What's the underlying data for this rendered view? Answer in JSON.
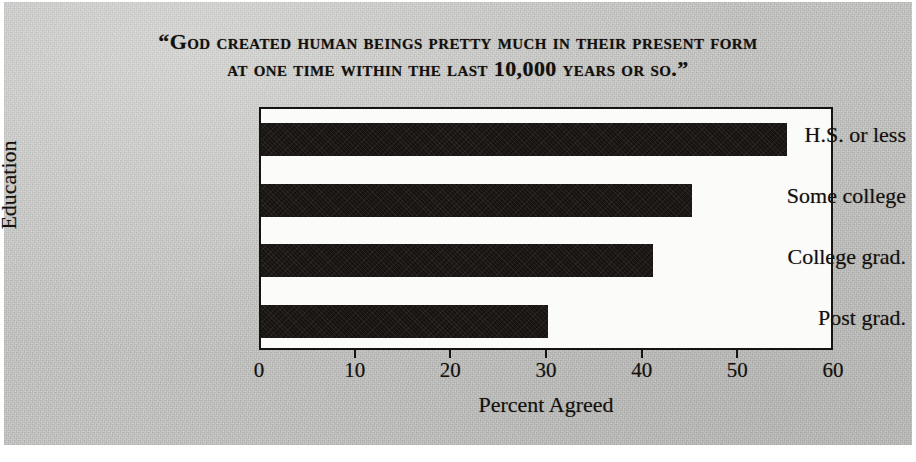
{
  "figure": {
    "title_lines": [
      "“God created human beings pretty much in their present form",
      "at one time within the last 10,000 years or so.”"
    ],
    "background_color": "#c9c9c7",
    "bar_color": "#171310",
    "plot_background_color": "#fbfbfa",
    "axis_color": "#17130f"
  },
  "chart_data": {
    "type": "bar",
    "orientation": "horizontal",
    "title": "“God created human beings pretty much in their present form at one time within the last 10,000 years or so.”",
    "categories": [
      "H.S. or less",
      "Some college",
      "College grad.",
      "Post grad."
    ],
    "values": [
      55,
      45,
      41,
      30
    ],
    "xlabel": "Percent Agreed",
    "ylabel": "Education",
    "xlim": [
      0,
      60
    ],
    "xticks": [
      0,
      10,
      20,
      30,
      40,
      50,
      60
    ],
    "xticklabels": [
      "0",
      "10",
      "20",
      "30",
      "40",
      "50",
      "60"
    ],
    "grid": false,
    "legend": false,
    "series": [
      {
        "name": "Percent Agreed",
        "values": [
          55,
          45,
          41,
          30
        ]
      }
    ]
  }
}
